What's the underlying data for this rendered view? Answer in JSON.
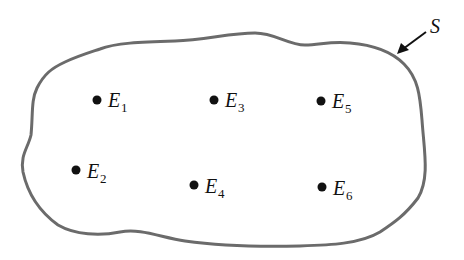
{
  "diagram": {
    "title": "",
    "boundary": {
      "label": "S",
      "stroke_color": "#6b6b6b",
      "stroke_width": 3
    },
    "points": [
      {
        "id": "E1",
        "letter": "E",
        "sub": "1",
        "x": 97,
        "y": 100
      },
      {
        "id": "E2",
        "letter": "E",
        "sub": "2",
        "x": 76,
        "y": 170
      },
      {
        "id": "E3",
        "letter": "E",
        "sub": "3",
        "x": 214,
        "y": 100
      },
      {
        "id": "E4",
        "letter": "E",
        "sub": "4",
        "x": 194,
        "y": 185
      },
      {
        "id": "E5",
        "letter": "E",
        "sub": "5",
        "x": 321,
        "y": 101
      },
      {
        "id": "E6",
        "letter": "E",
        "sub": "6",
        "x": 322,
        "y": 187
      }
    ],
    "dot_color": "#111111",
    "arrow_color": "#111111"
  }
}
